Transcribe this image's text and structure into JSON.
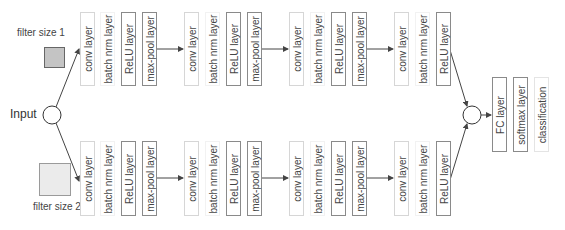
{
  "input": {
    "label": "Input"
  },
  "filters": [
    {
      "label": "filter size 1",
      "fill": "#c4c4c4",
      "border": "#666666"
    },
    {
      "label": "filter size 2",
      "fill": "#ebebeb",
      "border": "#9a9a9a"
    }
  ],
  "branches": {
    "top": {
      "groups": [
        [
          "conv layer",
          "batch nrm layer",
          "ReLU layer",
          "max-pool layer"
        ],
        [
          "conv layer",
          "batch nrm layer",
          "ReLU layer",
          "max-pool layer"
        ],
        [
          "conv layer",
          "batch nrm layer",
          "ReLU layer",
          "max-pool layer"
        ],
        [
          "conv layer",
          "batch nrm layer",
          "ReLU layer"
        ]
      ]
    },
    "bottom": {
      "groups": [
        [
          "conv layer",
          "batch nrm layer",
          "ReLU layer",
          "max-pool layer"
        ],
        [
          "conv layer",
          "batch nrm layer",
          "ReLU layer",
          "max-pool layer"
        ],
        [
          "conv layer",
          "batch nrm layer",
          "ReLU layer",
          "max-pool layer"
        ],
        [
          "conv layer",
          "batch nrm layer",
          "ReLU layer"
        ]
      ]
    }
  },
  "head": {
    "layers": [
      "FC layer",
      "softmax layer",
      "classification"
    ]
  },
  "colors": {
    "arrow": "#444444",
    "dark_border": "#8a8a8a",
    "light_border": "#d6d6d6"
  }
}
